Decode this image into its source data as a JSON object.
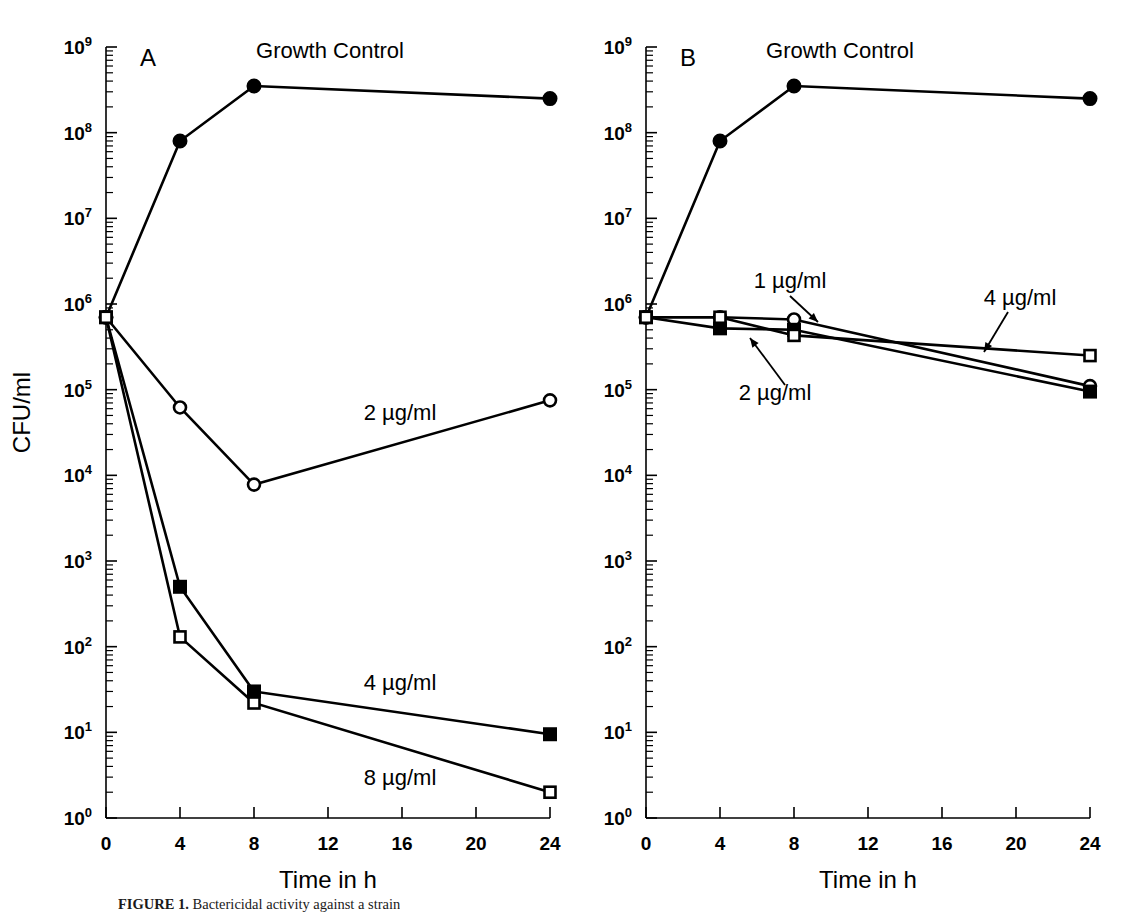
{
  "figure": {
    "ylabel": "CFU/ml",
    "xlabel": "Time in h",
    "caption_label": "FIGURE 1.",
    "caption_rest": "Bactericidal activity against a strain"
  },
  "chart_data": [
    {
      "type": "line",
      "panel": "A",
      "title": "",
      "xlabel": "Time in h",
      "ylabel": "CFU/ml",
      "xlim": [
        0,
        24
      ],
      "ylim": [
        1,
        1000000000
      ],
      "yscale": "log",
      "xticks": [
        0,
        4,
        8,
        12,
        16,
        20,
        24
      ],
      "xticklabels": [
        "0",
        "4",
        "8",
        "12",
        "16",
        "20",
        "24"
      ],
      "yticks": [
        1,
        10,
        100,
        1000,
        10000,
        100000,
        1000000,
        10000000,
        100000000,
        1000000000
      ],
      "yticklabels": [
        "10⁰",
        "10¹",
        "10²",
        "10³",
        "10⁴",
        "10⁵",
        "10⁶",
        "10⁷",
        "10⁸",
        "10⁹"
      ],
      "grid": false,
      "legend": "inline-annotations",
      "x": [
        0,
        4,
        8,
        24
      ],
      "series": [
        {
          "name": "Growth Control",
          "label": "Growth Control",
          "marker": "filled-circle",
          "values": [
            700000,
            80000000,
            350000000,
            250000000
          ]
        },
        {
          "name": "2 µg/ml",
          "label": "2 µg/ml",
          "marker": "open-circle",
          "values": [
            700000,
            62000,
            7800,
            75000
          ]
        },
        {
          "name": "4 µg/ml",
          "label": "4 µg/ml",
          "marker": "filled-square",
          "values": [
            700000,
            500,
            30,
            9.5
          ]
        },
        {
          "name": "8 µg/ml",
          "label": "8 µg/ml",
          "marker": "open-square",
          "values": [
            700000,
            130,
            22,
            2.0
          ]
        }
      ]
    },
    {
      "type": "line",
      "panel": "B",
      "title": "",
      "xlabel": "Time in h",
      "ylabel": "CFU/ml",
      "xlim": [
        0,
        24
      ],
      "ylim": [
        1,
        1000000000
      ],
      "yscale": "log",
      "xticks": [
        0,
        4,
        8,
        12,
        16,
        20,
        24
      ],
      "xticklabels": [
        "0",
        "4",
        "8",
        "12",
        "16",
        "20",
        "24"
      ],
      "yticks": [
        1,
        10,
        100,
        1000,
        10000,
        100000,
        1000000,
        10000000,
        100000000,
        1000000000
      ],
      "yticklabels": [
        "10⁰",
        "10¹",
        "10²",
        "10³",
        "10⁴",
        "10⁵",
        "10⁶",
        "10⁷",
        "10⁸",
        "10⁹"
      ],
      "grid": false,
      "legend": "inline-annotations",
      "x": [
        0,
        4,
        8,
        24
      ],
      "series": [
        {
          "name": "Growth Control",
          "label": "Growth Control",
          "marker": "filled-circle",
          "values": [
            700000,
            80000000,
            350000000,
            250000000
          ]
        },
        {
          "name": "1 µg/ml",
          "label": "1 µg/ml",
          "marker": "open-circle",
          "values": [
            700000,
            700000,
            660000,
            110000
          ]
        },
        {
          "name": "2 µg/ml",
          "label": "2 µg/ml",
          "marker": "filled-square",
          "values": [
            700000,
            520000,
            500000,
            95000
          ]
        },
        {
          "name": "4 µg/ml",
          "label": "4 µg/ml",
          "marker": "open-square",
          "values": [
            700000,
            700000,
            430000,
            250000
          ]
        }
      ]
    }
  ],
  "annotations": {
    "panelA": [
      {
        "name": "growth-control-label",
        "text": "Growth Control",
        "x": 330,
        "y": 58,
        "anchor": "middle",
        "leader": null
      },
      {
        "name": "conc-2-label",
        "text": "2 µg/ml",
        "x": 400,
        "y": 420,
        "anchor": "middle",
        "leader": null
      },
      {
        "name": "conc-4-label",
        "text": "4 µg/ml",
        "x": 400,
        "y": 690,
        "anchor": "middle",
        "leader": null
      },
      {
        "name": "conc-8-label",
        "text": "8 µg/ml",
        "x": 400,
        "y": 785,
        "anchor": "middle",
        "leader": null
      }
    ],
    "panelB": [
      {
        "name": "growth-control-label",
        "text": "Growth Control",
        "x": 840,
        "y": 58,
        "anchor": "middle",
        "leader": null
      },
      {
        "name": "conc-1-label",
        "text": "1 µg/ml",
        "x": 790,
        "y": 288,
        "anchor": "middle",
        "leader": {
          "x1": 790,
          "y1": 296,
          "x2": 818,
          "y2": 322
        }
      },
      {
        "name": "conc-2-label",
        "text": "2 µg/ml",
        "x": 775,
        "y": 400,
        "anchor": "middle",
        "leader": {
          "x1": 785,
          "y1": 385,
          "x2": 750,
          "y2": 338
        }
      },
      {
        "name": "conc-4-label",
        "text": "4 µg/ml",
        "x": 1020,
        "y": 305,
        "anchor": "middle",
        "leader": {
          "x1": 1008,
          "y1": 312,
          "x2": 984,
          "y2": 352
        }
      }
    ]
  },
  "panels": {
    "a_letter": "A",
    "b_letter": "B"
  }
}
